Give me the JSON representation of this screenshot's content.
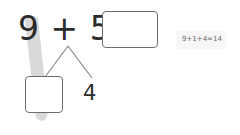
{
  "equation": {
    "addend1": "9",
    "operator": "+",
    "addend2": "5",
    "equals": "=",
    "answer_value": ""
  },
  "number_bond": {
    "split_first_part_value": "",
    "split_second_part_value": "4"
  },
  "hint": {
    "text": "9+1+4=14"
  },
  "colors": {
    "text": "#2b2b2b",
    "box_border": "#6e6e6e",
    "highlight": "#cfcfcf",
    "hint_background": "#f7f7f7"
  }
}
